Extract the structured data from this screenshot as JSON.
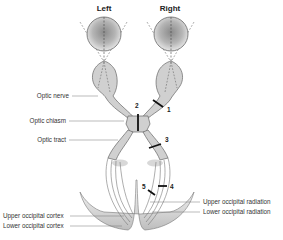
{
  "diagram": {
    "headers": {
      "left": "Left",
      "right": "Right"
    },
    "labels": {
      "optic_nerve": "Optic nerve",
      "optic_chiasm": "Optic chiasm",
      "optic_tract": "Optic tract",
      "upper_occipital_cortex": "Upper occipital cortex",
      "lower_occipital_cortex": "Lower occipital cortex",
      "upper_occipital_radiation": "Upper occipital radiation",
      "lower_occipital_radiation": "Lower occipital radiation"
    },
    "lesion_markers": [
      "1",
      "2",
      "3",
      "4",
      "5"
    ],
    "colors": {
      "structure_fill": "#d0d0d0",
      "outline": "#666666",
      "lesion": "#111111",
      "leader_line": "#777777"
    }
  }
}
